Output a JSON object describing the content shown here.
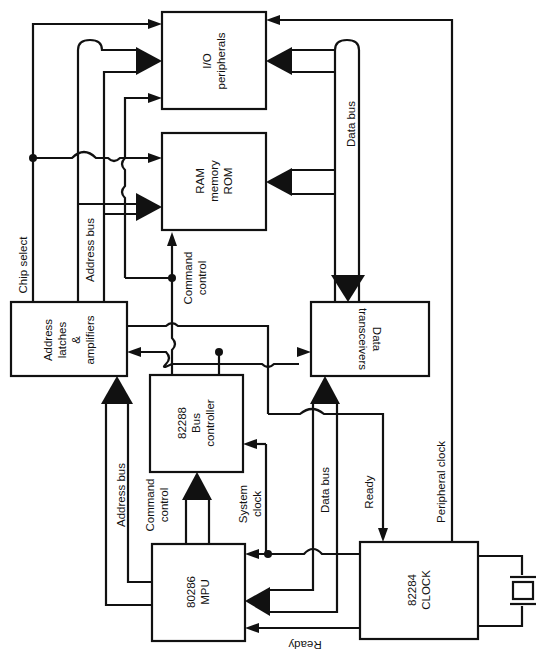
{
  "diagram": {
    "orientation": "rotated 90 degrees counter-clockwise",
    "blocks": {
      "io": {
        "line1": "I/O",
        "line2": "peripherals"
      },
      "ram": {
        "line1": "RAM",
        "line2": "memory",
        "line3": "ROM"
      },
      "latches": {
        "line1": "Address",
        "line2": "latches",
        "line3": "&",
        "line4": "amplifiers"
      },
      "transceivers": {
        "line1": "Data",
        "line2": "transceivers"
      },
      "buscontroller": {
        "line1": "82288",
        "line2": "Bus",
        "line3": "controller"
      },
      "mpu": {
        "line1": "80286",
        "line2": "MPU"
      },
      "clock": {
        "line1": "82284",
        "line2": "CLOCK"
      }
    },
    "labels": {
      "chip_select": "Chip select",
      "address_bus_top": "Address bus",
      "command_control_top": {
        "line1": "Command",
        "line2": "control"
      },
      "data_bus_top": "Data bus",
      "address_bus_bottom": "Address bus",
      "command_control_bottom": {
        "line1": "Command",
        "line2": "control"
      },
      "system_clock": {
        "line1": "System",
        "line2": "clock"
      },
      "data_bus_bottom": "Data bus",
      "ready_mid": "Ready",
      "peripheral_clock": "Peripheral clock",
      "ready_bottom": "Ready"
    },
    "components": {
      "crystal": "crystal-oscillator"
    }
  }
}
